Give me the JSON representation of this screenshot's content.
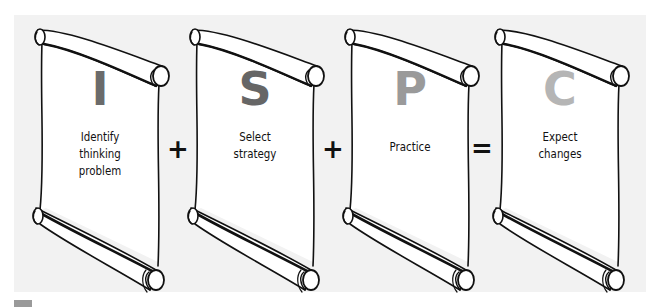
{
  "diagram": {
    "background_color": "#f2f2f2",
    "steps": [
      {
        "letter": "I",
        "label_lines": [
          "Identify",
          "thinking",
          "problem"
        ],
        "letter_color": "#6b6b6b"
      },
      {
        "letter": "S",
        "label_lines": [
          "Select",
          "strategy"
        ],
        "letter_color": "#666666"
      },
      {
        "letter": "P",
        "label_lines": [
          "Practice"
        ],
        "letter_color": "#9a9a9a"
      },
      {
        "letter": "C",
        "label_lines": [
          "Expect",
          "changes"
        ],
        "letter_color": "#b5b5b5"
      }
    ],
    "operators": [
      "+",
      "+",
      "="
    ]
  }
}
